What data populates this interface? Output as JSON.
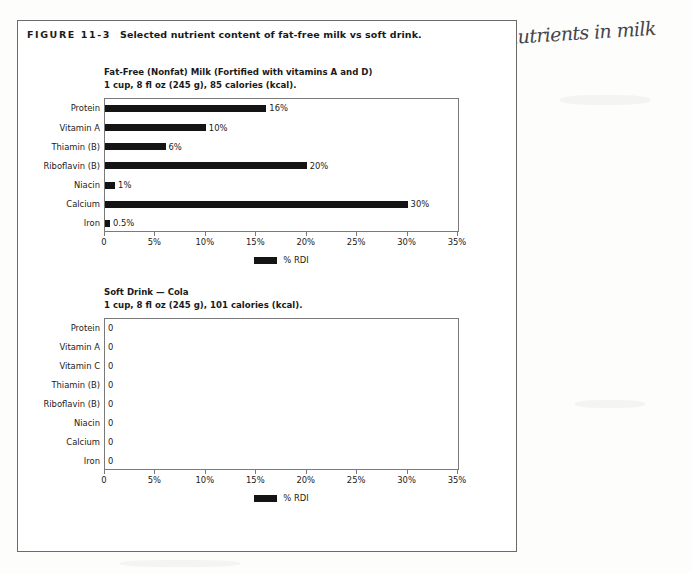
{
  "figure": {
    "label": "FIGURE 11-3",
    "title": "Selected nutrient content of fat-free milk vs soft drink."
  },
  "annotation": {
    "handwritten_note": "many more nutrients in milk"
  },
  "legend": {
    "series_label": "% RDI",
    "bar_color": "#141414"
  },
  "axis": {
    "tick_labels": [
      "0",
      "5%",
      "10%",
      "15%",
      "20%",
      "25%",
      "30%",
      "35%"
    ],
    "min": 0,
    "max": 35
  },
  "chart_data": [
    {
      "type": "bar",
      "id": "fat-free-milk",
      "title": "Fat-Free (Nonfat) Milk (Fortified with vitamins A and D)",
      "subtitle": "1 cup, 8 fl oz (245 g), 85 calories (kcal).",
      "orientation": "horizontal",
      "categories": [
        "Protein",
        "Vitamin A",
        "Thiamin (B)",
        "Riboflavin (B)",
        "Niacin",
        "Calcium",
        "Iron"
      ],
      "values": [
        16,
        10,
        6,
        20,
        1,
        30,
        0.5
      ],
      "value_labels": [
        "16%",
        "10%",
        "6%",
        "20%",
        "1%",
        "30%",
        "0.5%"
      ],
      "xlabel": "",
      "ylabel": "",
      "xlim": [
        0,
        35
      ],
      "grid": false,
      "legend_position": "bottom",
      "legend_entries": [
        "% RDI"
      ]
    },
    {
      "type": "bar",
      "id": "soft-drink-cola",
      "title": "Soft Drink — Cola",
      "subtitle": "1 cup, 8 fl oz (245 g), 101 calories (kcal).",
      "orientation": "horizontal",
      "categories": [
        "Protein",
        "Vitamin A",
        "Vitamin C",
        "Thiamin (B)",
        "Riboflavin (B)",
        "Niacin",
        "Calcium",
        "Iron"
      ],
      "values": [
        0,
        0,
        0,
        0,
        0,
        0,
        0,
        0
      ],
      "value_labels": [
        "0",
        "0",
        "0",
        "0",
        "0",
        "0",
        "0",
        "0"
      ],
      "xlabel": "",
      "ylabel": "",
      "xlim": [
        0,
        35
      ],
      "grid": false,
      "legend_position": "bottom",
      "legend_entries": [
        "% RDI"
      ]
    }
  ]
}
